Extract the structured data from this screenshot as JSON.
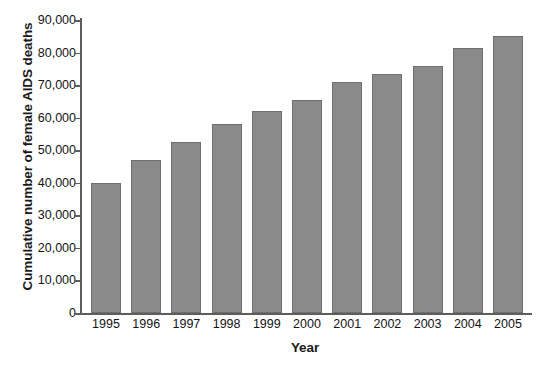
{
  "chart_data": {
    "type": "bar",
    "title": "",
    "subtitle": "",
    "xlabel": "Year",
    "ylabel": "Cumulative number of female AIDS deaths",
    "categories": [
      "1995",
      "1996",
      "1997",
      "1998",
      "1999",
      "2000",
      "2001",
      "2002",
      "2003",
      "2004",
      "2005"
    ],
    "values": [
      40000,
      47000,
      52500,
      58000,
      62000,
      65500,
      71000,
      73500,
      76000,
      81500,
      85000
    ],
    "series": [
      {
        "name": "Cumulative female AIDS deaths",
        "values": [
          40000,
          47000,
          52500,
          58000,
          62000,
          65500,
          71000,
          73500,
          76000,
          81500,
          85000
        ]
      }
    ],
    "ylim": [
      0,
      90000
    ],
    "ytick_values": [
      0,
      10000,
      20000,
      30000,
      40000,
      50000,
      60000,
      70000,
      80000,
      90000
    ],
    "ytick_labels": [
      "0",
      "10,000",
      "20,000",
      "30,000",
      "40,000",
      "50,000",
      "60,000",
      "70,000",
      "80,000",
      "90,000"
    ],
    "grid": false,
    "legend": false,
    "legend_position": "none",
    "bar_color": "#8a8a8a",
    "bar_border_color": "#6f6f6f",
    "axis_color": "#5d5d5d",
    "background_color": "#ffffff",
    "annotations": []
  }
}
